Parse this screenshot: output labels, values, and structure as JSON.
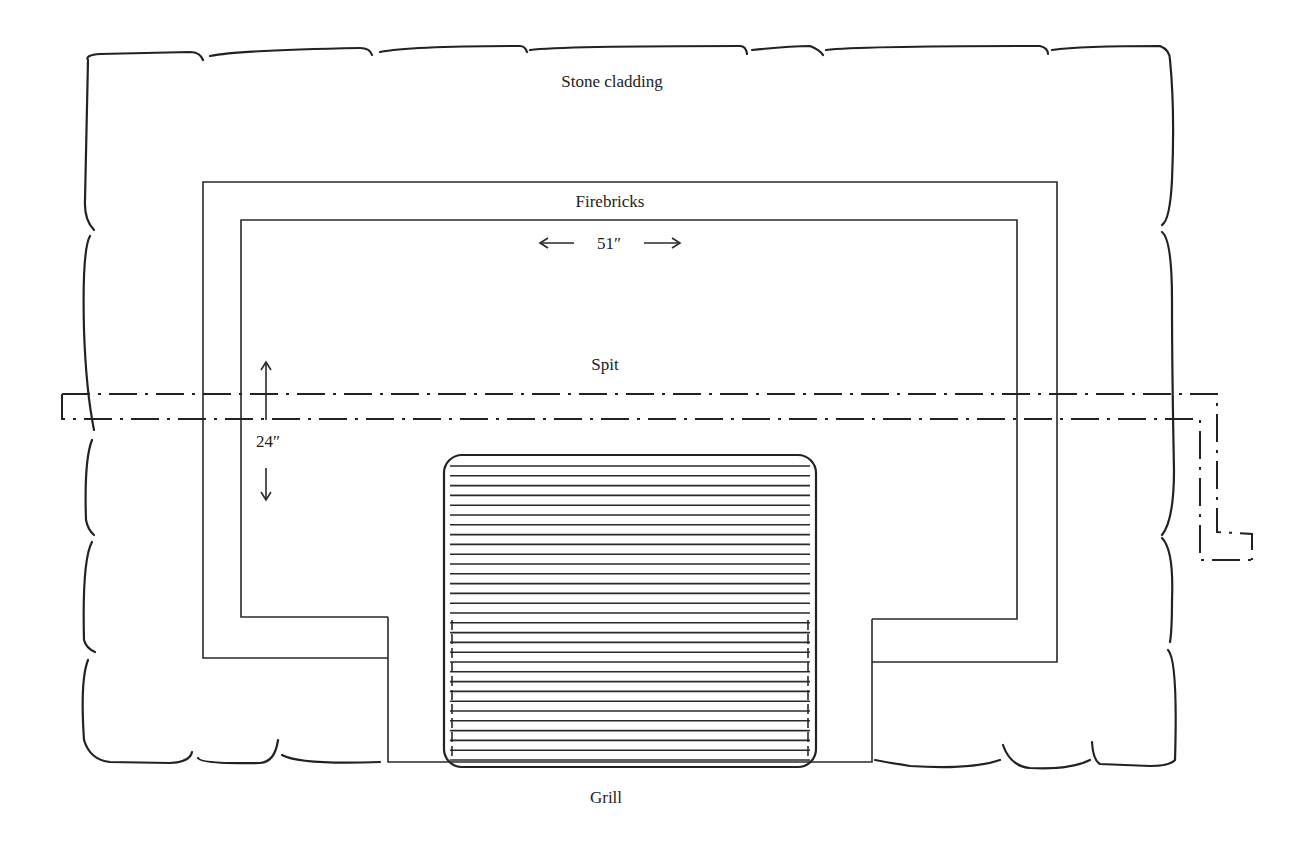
{
  "diagram": {
    "type": "fireplace-plan",
    "labels": {
      "stone_cladding": "Stone cladding",
      "firebricks": "Firebricks",
      "width_dimension": "51″",
      "spit": "Spit",
      "depth_dimension": "24″",
      "grill": "Grill"
    },
    "colors": {
      "ink": "#222222",
      "background": "#ffffff"
    }
  }
}
